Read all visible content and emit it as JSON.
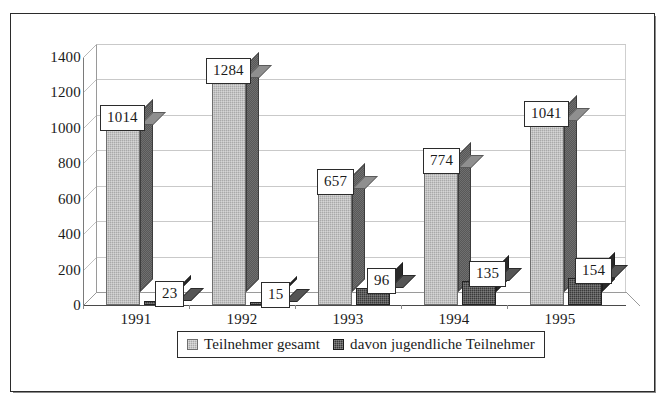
{
  "chart_data": {
    "type": "bar",
    "title": "",
    "subtitle": "",
    "xlabel": "",
    "ylabel": "",
    "categories": [
      "1991",
      "1992",
      "1993",
      "1994",
      "1995"
    ],
    "series": [
      {
        "name": "Teilnehmer gesamt",
        "values": [
          1014,
          1284,
          657,
          774,
          1041
        ],
        "color": "#a9a9a9"
      },
      {
        "name": "davon jugendliche Teilnehmer",
        "values": [
          23,
          15,
          96,
          135,
          154
        ],
        "color": "#3a3a3a"
      }
    ],
    "ylim": [
      0,
      1400
    ],
    "ytick_labels": [
      "0",
      "200",
      "400",
      "600",
      "800",
      "1000",
      "1200",
      "1400"
    ],
    "ytick_values": [
      0,
      200,
      400,
      600,
      800,
      1000,
      1200,
      1400
    ],
    "grid": true,
    "legend_position": "bottom",
    "three_d": true,
    "data_labels_shown": true
  },
  "legend": {
    "entries": [
      {
        "label": "Teilnehmer gesamt",
        "swatch": "legend-swatch-light-gray"
      },
      {
        "label": "davon jugendliche Teilnehmer",
        "swatch": "legend-swatch-dark-gray"
      }
    ]
  }
}
